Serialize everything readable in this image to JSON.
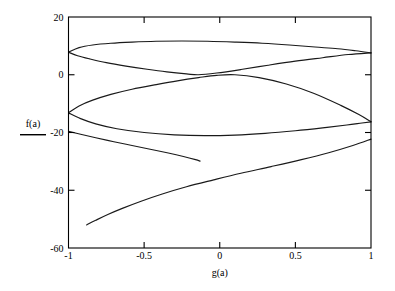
{
  "chart_data": {
    "type": "line",
    "title": "",
    "xlabel": "g(a)",
    "ylabel": "f(a)",
    "xlim": [
      -1,
      1
    ],
    "ylim": [
      -60,
      20
    ],
    "grid": false,
    "legend": null,
    "x_ticks": [
      {
        "value": -1,
        "label": "-1"
      },
      {
        "value": -0.5,
        "label": "-0.5"
      },
      {
        "value": 0,
        "label": "0"
      },
      {
        "value": 0.5,
        "label": "0.5"
      },
      {
        "value": 1,
        "label": "1"
      }
    ],
    "y_ticks": [
      {
        "value": 20,
        "label": "20"
      },
      {
        "value": 0,
        "label": "0"
      },
      {
        "value": -20,
        "label": "-20"
      },
      {
        "value": -40,
        "label": "-40"
      },
      {
        "value": -60,
        "label": "-60"
      }
    ],
    "line_color": "#1a1a1a",
    "series": [
      {
        "name": "upper-lens-top",
        "points": [
          [
            -1.0,
            7.8
          ],
          [
            -0.93,
            9.4
          ],
          [
            -0.84,
            10.3
          ],
          [
            -0.72,
            10.9
          ],
          [
            -0.58,
            11.3
          ],
          [
            -0.42,
            11.6
          ],
          [
            -0.25,
            11.7
          ],
          [
            -0.08,
            11.6
          ],
          [
            0.1,
            11.3
          ],
          [
            0.28,
            10.9
          ],
          [
            0.46,
            10.3
          ],
          [
            0.63,
            9.6
          ],
          [
            0.78,
            9.0
          ],
          [
            0.9,
            8.3
          ],
          [
            1.0,
            7.6
          ]
        ]
      },
      {
        "name": "upper-lens-bottom",
        "points": [
          [
            -1.0,
            7.8
          ],
          [
            -0.94,
            6.6
          ],
          [
            -0.86,
            5.5
          ],
          [
            -0.75,
            4.2
          ],
          [
            -0.62,
            3.0
          ],
          [
            -0.48,
            1.9
          ],
          [
            -0.35,
            1.0
          ],
          [
            -0.22,
            0.3
          ],
          [
            -0.14,
            0.0
          ],
          [
            -0.02,
            0.6
          ],
          [
            0.14,
            1.8
          ],
          [
            0.32,
            3.3
          ],
          [
            0.5,
            4.7
          ],
          [
            0.68,
            5.9
          ],
          [
            0.85,
            7.0
          ],
          [
            1.0,
            7.6
          ]
        ]
      },
      {
        "name": "lower-lens-top",
        "points": [
          [
            -1.0,
            -13.2
          ],
          [
            -0.93,
            -10.8
          ],
          [
            -0.84,
            -8.8
          ],
          [
            -0.72,
            -6.8
          ],
          [
            -0.58,
            -5.0
          ],
          [
            -0.42,
            -3.4
          ],
          [
            -0.28,
            -2.1
          ],
          [
            -0.14,
            -1.0
          ],
          [
            -0.02,
            -0.2
          ],
          [
            0.1,
            0.0
          ],
          [
            0.26,
            -1.0
          ],
          [
            0.44,
            -3.2
          ],
          [
            0.62,
            -6.4
          ],
          [
            0.8,
            -10.6
          ],
          [
            0.92,
            -13.8
          ],
          [
            1.0,
            -16.3
          ]
        ]
      },
      {
        "name": "lower-lens-bottom",
        "points": [
          [
            -1.0,
            -13.2
          ],
          [
            -0.92,
            -15.2
          ],
          [
            -0.82,
            -17.0
          ],
          [
            -0.68,
            -18.7
          ],
          [
            -0.5,
            -20.0
          ],
          [
            -0.3,
            -20.8
          ],
          [
            -0.1,
            -21.1
          ],
          [
            0.1,
            -20.9
          ],
          [
            0.3,
            -20.3
          ],
          [
            0.5,
            -19.4
          ],
          [
            0.68,
            -18.4
          ],
          [
            0.84,
            -17.4
          ],
          [
            0.94,
            -16.7
          ],
          [
            1.0,
            -16.3
          ]
        ]
      },
      {
        "name": "open-branch-upper",
        "points": [
          [
            -1.0,
            -19.6
          ],
          [
            -0.92,
            -20.6
          ],
          [
            -0.82,
            -21.8
          ],
          [
            -0.7,
            -23.2
          ],
          [
            -0.58,
            -24.5
          ],
          [
            -0.46,
            -25.8
          ],
          [
            -0.34,
            -27.1
          ],
          [
            -0.24,
            -28.3
          ],
          [
            -0.16,
            -29.4
          ],
          [
            -0.13,
            -29.9
          ]
        ]
      },
      {
        "name": "open-branch-lower",
        "points": [
          [
            -0.88,
            -52.0
          ],
          [
            -0.82,
            -50.4
          ],
          [
            -0.74,
            -48.4
          ],
          [
            -0.64,
            -46.2
          ],
          [
            -0.52,
            -43.8
          ],
          [
            -0.38,
            -41.3
          ],
          [
            -0.22,
            -38.8
          ],
          [
            -0.04,
            -36.4
          ],
          [
            0.14,
            -34.1
          ],
          [
            0.34,
            -31.8
          ],
          [
            0.54,
            -29.4
          ],
          [
            0.72,
            -27.0
          ],
          [
            0.88,
            -24.5
          ],
          [
            1.0,
            -22.3
          ]
        ]
      }
    ]
  },
  "axis_label_x": "g(a)",
  "axis_label_y": "f(a)"
}
